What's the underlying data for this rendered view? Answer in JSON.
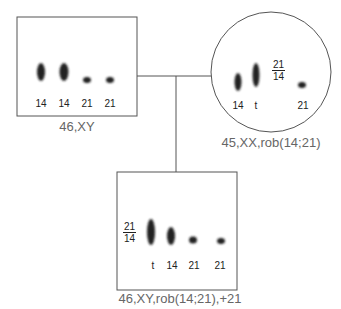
{
  "father": {
    "karyotype": "46,XY",
    "lanes": [
      "14",
      "14",
      "21",
      "21"
    ]
  },
  "mother": {
    "karyotype": "45,XX,rob(14;21)",
    "lanes": [
      "14",
      "t",
      "21"
    ],
    "translocation_label": {
      "top": "21",
      "bottom": "14"
    }
  },
  "child": {
    "karyotype": "46,XY,rob(14;21),+21",
    "lanes": [
      "t",
      "14",
      "21",
      "21"
    ],
    "translocation_label": {
      "top": "21",
      "bottom": "14"
    }
  }
}
